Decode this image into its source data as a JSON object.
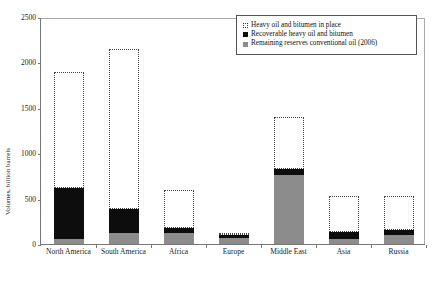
{
  "chart_data": {
    "type": "bar",
    "title": "",
    "subtitle": "",
    "xlabel": "",
    "ylabel": "Volumes, billion barrels",
    "ylim": [
      0,
      2500
    ],
    "yticks": [
      0,
      500,
      1000,
      1500,
      2000,
      2500
    ],
    "ytick_labels": [
      "0",
      "500",
      "1000",
      "1500",
      "2000",
      "2500"
    ],
    "grid": false,
    "legend_position": "top-right",
    "stacked": true,
    "categories": [
      "North America",
      "South America",
      "Africa",
      "Europe",
      "Middle East",
      "Asia",
      "Russia"
    ],
    "series": [
      {
        "name": "Remaining reserves conventional oil (2006)",
        "style": "solid-gray",
        "color": "#8c8c8c",
        "values": [
          55,
          120,
          120,
          65,
          765,
          60,
          100
        ]
      },
      {
        "name": "Recoverable heavy oil and bitumen",
        "style": "solid-black",
        "color": "#0d0d0d",
        "values": [
          620,
          390,
          180,
          100,
          830,
          130,
          150
        ]
      },
      {
        "name": "Heavy oil and bitumen in place",
        "style": "dotted-outline",
        "color": "#444444",
        "values": [
          1900,
          2150,
          600,
          110,
          1400,
          530,
          530
        ]
      }
    ]
  },
  "legend": {
    "items": [
      {
        "label": "Heavy oil and bitumen in place",
        "swatch": "dotted-outline-square-icon"
      },
      {
        "label": "Recoverable heavy oil and bitumen",
        "swatch": "black-square-icon"
      },
      {
        "label": "Remaining reserves conventional oil (2006)",
        "swatch": "gray-square-icon"
      }
    ]
  },
  "caption": ""
}
